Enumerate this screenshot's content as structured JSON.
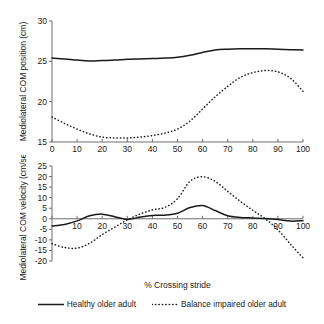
{
  "figure": {
    "background": "#ffffff",
    "ink_color": "#1a1a1a",
    "axis_color": "#6e6e6e"
  },
  "legend": {
    "position": "bottom-center",
    "entries": [
      {
        "label": "Healthy older adult",
        "style": "solid",
        "swatch_name": "legend-swatch-solid"
      },
      {
        "label": "Balance impaired older adult",
        "style": "dotted",
        "swatch_name": "legend-swatch-dotted"
      }
    ]
  },
  "chart_data": [
    {
      "id": "com-position",
      "type": "line",
      "title": "",
      "xlabel": "",
      "ylabel": "Mediolateral COM position (cm)",
      "xlim": [
        0,
        100
      ],
      "ylim": [
        15,
        30
      ],
      "xticks": [
        0,
        10,
        20,
        30,
        40,
        50,
        60,
        70,
        80,
        90,
        100
      ],
      "yticks": [
        15,
        20,
        25,
        30
      ],
      "xticklabels": [
        "0",
        "10",
        "20",
        "30",
        "40",
        "50",
        "60",
        "70",
        "80",
        "90",
        "100"
      ],
      "yticklabels": [
        "15",
        "20",
        "25",
        "30"
      ],
      "grid": false,
      "x": [
        0,
        5,
        10,
        15,
        20,
        25,
        30,
        35,
        40,
        45,
        50,
        55,
        60,
        65,
        70,
        75,
        80,
        85,
        90,
        95,
        100
      ],
      "series": [
        {
          "name": "Healthy older adult",
          "style": "solid",
          "values": [
            25.4,
            25.3,
            25.15,
            25.05,
            25.1,
            25.15,
            25.25,
            25.3,
            25.35,
            25.4,
            25.5,
            25.75,
            26.1,
            26.4,
            26.5,
            26.55,
            26.55,
            26.55,
            26.5,
            26.45,
            26.4
          ]
        },
        {
          "name": "Balance impaired older adult",
          "style": "dotted",
          "values": [
            18.1,
            17.3,
            16.6,
            16.0,
            15.6,
            15.5,
            15.5,
            15.6,
            15.8,
            16.1,
            16.6,
            17.6,
            19.1,
            20.6,
            21.9,
            23.0,
            23.6,
            23.85,
            23.7,
            22.9,
            21.3
          ]
        }
      ]
    },
    {
      "id": "com-velocity",
      "type": "line",
      "title": "",
      "xlabel": "% Crossing stride",
      "ylabel": "Mediolateral COM velocity (cm/sec)",
      "xlim": [
        0,
        100
      ],
      "ylim": [
        -20,
        25
      ],
      "xticks": [
        0,
        10,
        20,
        30,
        40,
        50,
        60,
        70,
        80,
        90,
        100
      ],
      "yticks": [
        -20,
        -15,
        -10,
        -5,
        0,
        5,
        10,
        15,
        20,
        25
      ],
      "xticklabels": [
        "",
        "10",
        "20",
        "30",
        "40",
        "50",
        "60",
        "70",
        "80",
        "90",
        "100"
      ],
      "yticklabels": [
        "-20",
        "-15",
        "-10",
        "-5",
        "0",
        "5",
        "10",
        "15",
        "20",
        "25"
      ],
      "grid": false,
      "zero_line": 0,
      "x": [
        0,
        5,
        10,
        15,
        20,
        25,
        30,
        35,
        40,
        45,
        50,
        55,
        60,
        65,
        70,
        75,
        80,
        85,
        90,
        95,
        100
      ],
      "series": [
        {
          "name": "Healthy older adult",
          "style": "solid",
          "values": [
            -3.4,
            -2.7,
            -1.0,
            1.4,
            2.2,
            1.0,
            -0.3,
            0.8,
            1.6,
            1.7,
            2.6,
            5.3,
            6.3,
            3.9,
            1.4,
            0.6,
            0.4,
            0.1,
            -0.4,
            -1.1,
            -0.9
          ]
        },
        {
          "name": "Balance impaired older adult",
          "style": "dotted",
          "values": [
            -11.8,
            -13.6,
            -13.9,
            -11.6,
            -7.5,
            -4.0,
            -0.5,
            2.2,
            4.2,
            5.4,
            9.5,
            17.8,
            19.9,
            17.7,
            13.0,
            8.3,
            4.0,
            0.0,
            -5.2,
            -12.0,
            -18.5
          ]
        }
      ]
    }
  ]
}
